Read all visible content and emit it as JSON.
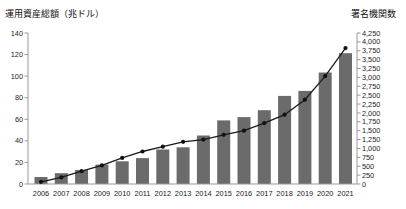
{
  "chart_data": {
    "type": "bar",
    "subtype": "bar-and-line-dual-axis",
    "categories": [
      "2006",
      "2007",
      "2008",
      "2009",
      "2010",
      "2011",
      "2012",
      "2013",
      "2014",
      "2015",
      "2016",
      "2017",
      "2018",
      "2019",
      "2020",
      "2021"
    ],
    "series": [
      {
        "name": "運用資産総額（兆ドル）",
        "type": "bar",
        "axis": "left",
        "values": [
          6.5,
          10,
          13,
          18,
          21,
          24,
          32,
          34,
          45,
          59,
          62,
          68.4,
          81.7,
          86.3,
          103.4,
          121.3
        ]
      },
      {
        "name": "署名機関数",
        "type": "line",
        "axis": "right",
        "values": [
          63,
          185,
          361,
          523,
          734,
          915,
          1050,
          1188,
          1251,
          1384,
          1501,
          1714,
          1951,
          2372,
          3038,
          3826
        ]
      }
    ],
    "left_axis": {
      "title": "運用資産総額（兆ドル）",
      "min": 0,
      "max": 140,
      "step": 20
    },
    "right_axis": {
      "title": "署名機関数",
      "min": 0,
      "max": 4250,
      "step": 250
    },
    "grid": false,
    "legend": "none",
    "colors": {
      "bar": "#6b6b6b",
      "line": "#1a1a1a",
      "marker": "#111111",
      "axis": "#999999",
      "text": "#222222"
    }
  }
}
